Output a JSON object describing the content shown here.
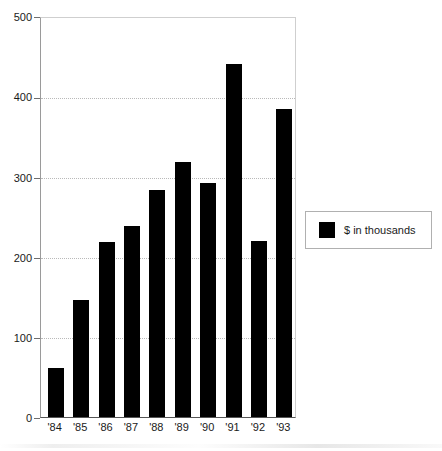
{
  "chart_data": {
    "type": "bar",
    "title": "",
    "subtitle": "",
    "xlabel": "",
    "ylabel": "",
    "categories": [
      "'84",
      "'85",
      "'86",
      "'87",
      "'88",
      "'89",
      "'90",
      "'91",
      "'92",
      "'93"
    ],
    "values": [
      62,
      147,
      219,
      239,
      284,
      319,
      293,
      442,
      221,
      386
    ],
    "series": [
      {
        "name": "$ in thousands",
        "color": "#000000",
        "values": [
          62,
          147,
          219,
          239,
          284,
          319,
          293,
          442,
          221,
          386
        ]
      }
    ],
    "ylim": [
      0,
      500
    ],
    "y_ticks": [
      0,
      100,
      200,
      300,
      400,
      500
    ],
    "y_tick_labels": [
      "0",
      "100",
      "200",
      "300",
      "400",
      "500"
    ],
    "gridlines": [
      100,
      200,
      300,
      400
    ],
    "grid": true,
    "grid_style": "dotted",
    "grid_color": "#b9b9b9",
    "legend": {
      "position": "right",
      "entries": [
        {
          "label": "$ in thousands",
          "color": "#000000"
        }
      ]
    },
    "bar_color": "#000000",
    "plot_background": "#ffffff",
    "axis_color": "#555555"
  }
}
